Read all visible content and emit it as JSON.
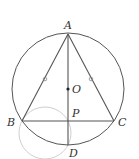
{
  "figure": {
    "type": "geometry",
    "colors": {
      "stroke": "#555555",
      "aux_circle": "#c8c8c8",
      "label": "#333333"
    },
    "points": {
      "A": "A",
      "B": "B",
      "C": "C",
      "O": "O",
      "P": "P",
      "D": "D"
    },
    "segments": [
      "AB",
      "AC",
      "BC",
      "AD"
    ],
    "equal_marks": [
      "AB",
      "AC"
    ],
    "circles": [
      "circumcircle-O",
      "auxiliary-circle"
    ]
  }
}
